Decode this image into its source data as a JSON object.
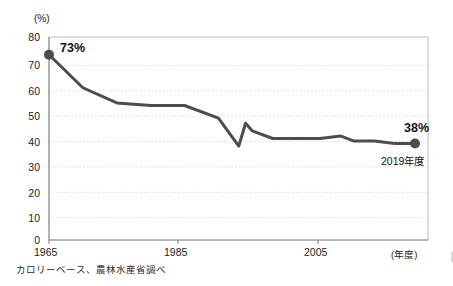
{
  "chart_data": {
    "type": "line",
    "title": "",
    "xlabel": "(年度)",
    "ylabel": "(%)",
    "xlim": [
      1965,
      2019
    ],
    "ylim": [
      0,
      80
    ],
    "grid": true,
    "legend": null,
    "y_ticks": [
      80,
      70,
      60,
      50,
      40,
      30,
      20,
      10,
      0
    ],
    "x_ticks": [
      1965,
      1985,
      2005
    ],
    "series": [
      {
        "name": "食料自給率（カロリーベース）",
        "color": "#4d4d4d",
        "x": [
          1965,
          1970,
          1975,
          1980,
          1985,
          1990,
          1993,
          1994,
          1995,
          1998,
          2000,
          2005,
          2008,
          2010,
          2013,
          2016,
          2017,
          2019
        ],
        "values": [
          73,
          60,
          54,
          53,
          53,
          48,
          37,
          46,
          43,
          40,
          40,
          40,
          41,
          39,
          39,
          38,
          38,
          38
        ]
      }
    ],
    "annotations": [
      {
        "name": "start-value-label",
        "text": "73%",
        "x": 1965,
        "y": 73
      },
      {
        "name": "end-value-label",
        "text": "38%",
        "x": 2019,
        "y": 38
      },
      {
        "name": "end-year-label",
        "text": "2019年度",
        "x": 2019,
        "y": 38
      }
    ],
    "markers": [
      {
        "name": "start-marker",
        "x": 1965,
        "y": 73
      },
      {
        "name": "end-marker",
        "x": 2019,
        "y": 38
      }
    ],
    "source_note": "カロリーベース、農林水産省調べ"
  },
  "labels": {
    "y_unit": "(%)",
    "x_axis_title": "(年度)",
    "y_80": "80",
    "y_70": "70",
    "y_60": "60",
    "y_50": "50",
    "y_40": "40",
    "y_30": "30",
    "y_20": "20",
    "y_10": "10",
    "y_0": "0",
    "x_1965": "1965",
    "x_1985": "1985",
    "x_2005": "2005",
    "start_label": "73%",
    "end_label": "38%",
    "end_year": "2019年度",
    "source": "カロリーベース、農林水産省調べ",
    "edge_glyph": "【"
  },
  "colors": {
    "line": "#4d4d4d",
    "frame": "#b5b5b5",
    "grid": "#dcdcdc",
    "text": "#1a1a1a",
    "background": "#ffffff"
  }
}
